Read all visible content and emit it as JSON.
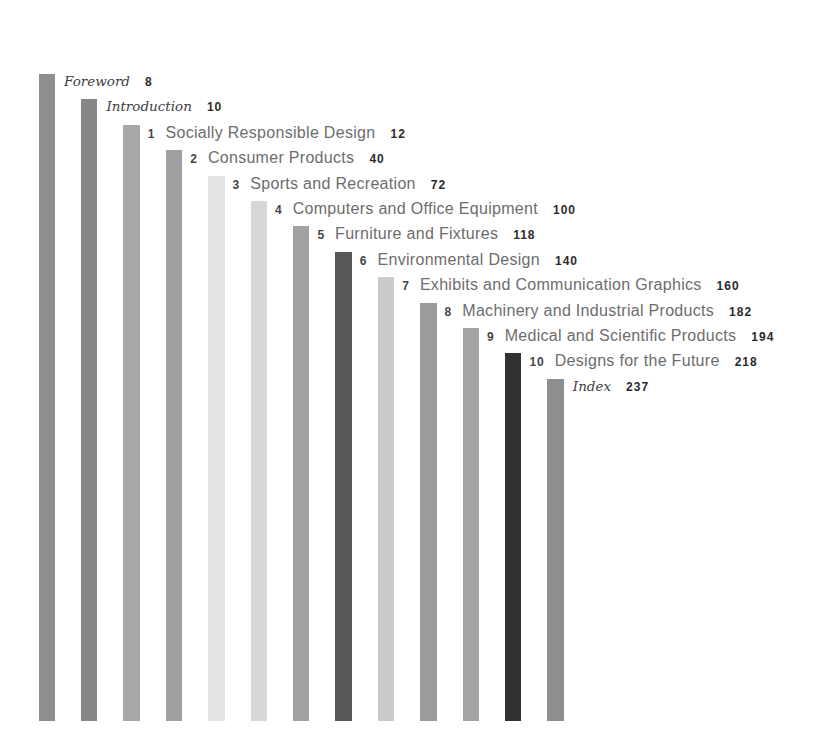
{
  "page": {
    "background": "#ffffff"
  },
  "palette": {
    "title_text": "#6d6d6d",
    "chapter_number_text": "#454545",
    "page_number_text": "#2b2b2b",
    "italic_label_text": "#3e3e3e"
  },
  "toc": {
    "items": [
      {
        "id": "foreword",
        "kind": "front",
        "number": "",
        "label": "Foreword",
        "page": "8",
        "bar_color": "#8e8e8e"
      },
      {
        "id": "introduction",
        "kind": "front",
        "number": "",
        "label": "Introduction",
        "page": "10",
        "bar_color": "#868686"
      },
      {
        "id": "chapter-1",
        "kind": "chapter",
        "number": "1",
        "label": "Socially Responsible Design",
        "page": "12",
        "bar_color": "#a8a8a8"
      },
      {
        "id": "chapter-2",
        "kind": "chapter",
        "number": "2",
        "label": "Consumer Products",
        "page": "40",
        "bar_color": "#a0a0a0"
      },
      {
        "id": "chapter-3",
        "kind": "chapter",
        "number": "3",
        "label": "Sports and Recreation",
        "page": "72",
        "bar_color": "#e3e3e3"
      },
      {
        "id": "chapter-4",
        "kind": "chapter",
        "number": "4",
        "label": "Computers and Office Equipment",
        "page": "100",
        "bar_color": "#d7d7d7"
      },
      {
        "id": "chapter-5",
        "kind": "chapter",
        "number": "5",
        "label": "Furniture and Fixtures",
        "page": "118",
        "bar_color": "#a2a2a2"
      },
      {
        "id": "chapter-6",
        "kind": "chapter",
        "number": "6",
        "label": "Environmental Design",
        "page": "140",
        "bar_color": "#575757"
      },
      {
        "id": "chapter-7",
        "kind": "chapter",
        "number": "7",
        "label": "Exhibits and Communication Graphics",
        "page": "160",
        "bar_color": "#cbcbcb"
      },
      {
        "id": "chapter-8",
        "kind": "chapter",
        "number": "8",
        "label": "Machinery and Industrial Products",
        "page": "182",
        "bar_color": "#9b9b9b"
      },
      {
        "id": "chapter-9",
        "kind": "chapter",
        "number": "9",
        "label": "Medical and Scientific Products",
        "page": "194",
        "bar_color": "#a4a4a4"
      },
      {
        "id": "chapter-10",
        "kind": "chapter",
        "number": "10",
        "label": "Designs for the Future",
        "page": "218",
        "bar_color": "#323232"
      },
      {
        "id": "index",
        "kind": "back",
        "number": "",
        "label": "Index",
        "page": "237",
        "bar_color": "#8e8e8e"
      }
    ]
  }
}
